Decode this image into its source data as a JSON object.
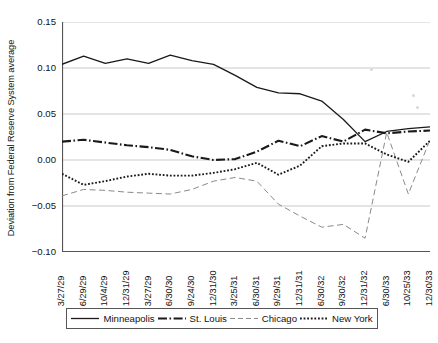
{
  "chart_data": {
    "type": "line",
    "title": "",
    "xlabel": "",
    "ylabel": "Deviation from Federal Reserve System average",
    "ylim": [
      -0.1,
      0.15
    ],
    "yticks": [
      0.15,
      0.1,
      0.05,
      0.0,
      -0.05,
      -0.1
    ],
    "ytick_labels": [
      "0.15",
      "0.10",
      "0.05",
      "0.00",
      "−0.05",
      "−0.10"
    ],
    "grid": "horizontal",
    "legend_position": "bottom",
    "categories": [
      "3/27/29",
      "6/29/29",
      "10/4/29",
      "12/31/29",
      "3/27/29",
      "6/30/30",
      "9/24/30",
      "12/31/30",
      "3/25/31",
      "6/30/31",
      "9/29/31",
      "12/31/31",
      "6/30/32",
      "9/30/32",
      "12/31/32",
      "6/30/33",
      "10/25/33",
      "12/30/33"
    ],
    "series": [
      {
        "name": "Minneapolis",
        "style": "solid",
        "color": "#1a1a1a",
        "values": [
          0.104,
          0.113,
          0.105,
          0.11,
          0.105,
          0.114,
          0.108,
          0.104,
          0.092,
          0.079,
          0.073,
          0.072,
          0.064,
          0.044,
          0.02,
          0.031,
          0.034,
          0.036
        ]
      },
      {
        "name": "St. Louis",
        "style": "dash-dot",
        "color": "#1a1a1a",
        "values": [
          0.02,
          0.022,
          0.019,
          0.016,
          0.014,
          0.011,
          0.004,
          0.0,
          0.001,
          0.009,
          0.021,
          0.015,
          0.026,
          0.02,
          0.033,
          0.029,
          0.031,
          0.032
        ]
      },
      {
        "name": "Chicago",
        "style": "long-dash",
        "color": "#8a8a8a",
        "values": [
          -0.039,
          -0.032,
          -0.033,
          -0.035,
          -0.036,
          -0.037,
          -0.032,
          -0.023,
          -0.019,
          -0.023,
          -0.048,
          -0.061,
          -0.073,
          -0.07,
          -0.085,
          0.03,
          -0.037,
          0.022
        ]
      },
      {
        "name": "New York",
        "style": "dotted",
        "color": "#1a1a1a",
        "values": [
          -0.015,
          -0.027,
          -0.023,
          -0.018,
          -0.015,
          -0.017,
          -0.017,
          -0.014,
          -0.01,
          -0.003,
          -0.016,
          -0.006,
          0.015,
          0.018,
          0.018,
          0.006,
          -0.002,
          0.021
        ]
      }
    ]
  },
  "legend": {
    "items": [
      {
        "label": "Minneapolis",
        "style": "solid"
      },
      {
        "label": "St. Louis",
        "style": "dash-dot"
      },
      {
        "label": "Chicago",
        "style": "long-dash"
      },
      {
        "label": "New York",
        "style": "dotted"
      }
    ]
  }
}
